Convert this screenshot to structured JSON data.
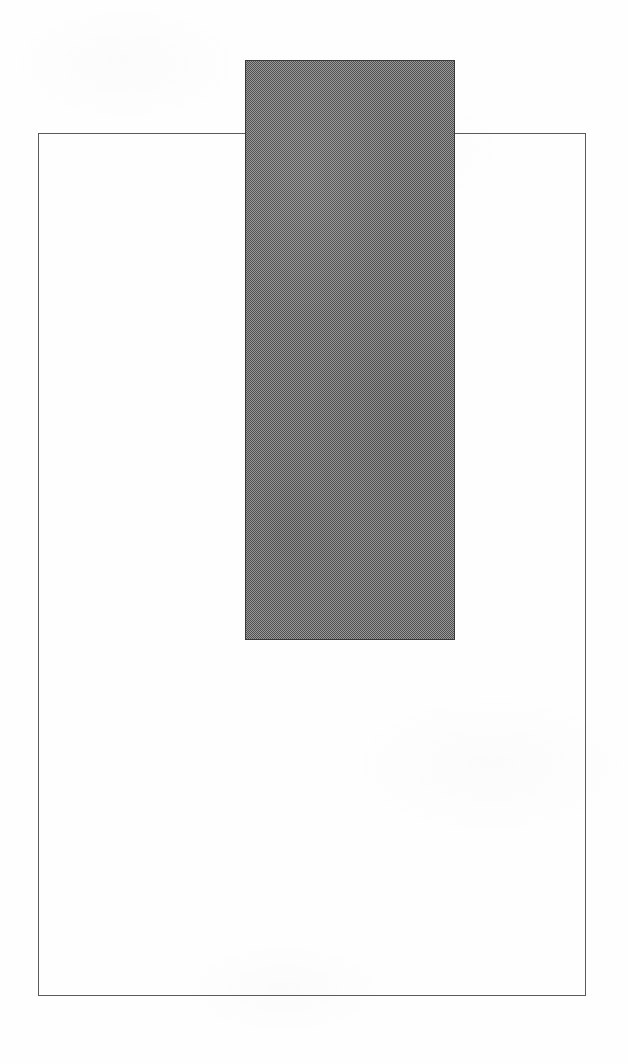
{
  "figure": {
    "canvas": {
      "width": 629,
      "height": 1063,
      "background_color": "#fefefe"
    },
    "shapes": [
      {
        "name": "outline-rectangle",
        "type": "rectangle",
        "fill": "none",
        "stroke_color": "#5a5a5a",
        "stroke_width": 1,
        "x": 38,
        "y": 133,
        "width": 548,
        "height": 863
      },
      {
        "name": "filled-rectangle",
        "type": "rectangle",
        "fill": "#767676",
        "fill_style": "halftone-dither",
        "stroke_color": "#3a3a3a",
        "stroke_width": 1,
        "x": 245,
        "y": 60,
        "width": 210,
        "height": 580
      }
    ]
  }
}
